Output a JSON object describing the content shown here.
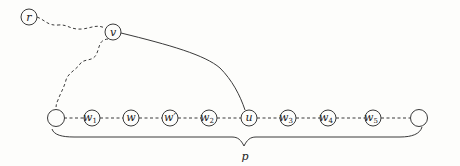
{
  "diagram": {
    "type": "graph",
    "colors": {
      "stroke": "#3a3a3a",
      "background": "#fdfdfb",
      "label": "#222222"
    },
    "nodes": [
      {
        "id": "r",
        "label": "r",
        "sub": "",
        "x": 29,
        "y": 17
      },
      {
        "id": "v",
        "label": "v",
        "sub": "",
        "x": 113,
        "y": 32
      },
      {
        "id": "start",
        "label": "",
        "sub": "",
        "x": 56,
        "y": 118
      },
      {
        "id": "w1",
        "label": "w",
        "sub": "1",
        "x": 92,
        "y": 118
      },
      {
        "id": "w",
        "label": "w",
        "sub": "",
        "x": 131,
        "y": 118
      },
      {
        "id": "wprime",
        "label": "w′",
        "sub": "",
        "x": 170,
        "y": 118
      },
      {
        "id": "w2",
        "label": "w",
        "sub": "2",
        "x": 209,
        "y": 118
      },
      {
        "id": "u",
        "label": "u",
        "sub": "",
        "x": 249,
        "y": 118
      },
      {
        "id": "w3",
        "label": "w",
        "sub": "3",
        "x": 288,
        "y": 118
      },
      {
        "id": "w4",
        "label": "w",
        "sub": "4",
        "x": 328,
        "y": 118
      },
      {
        "id": "w5",
        "label": "w",
        "sub": "5",
        "x": 373,
        "y": 118
      },
      {
        "id": "end",
        "label": "",
        "sub": "",
        "x": 419,
        "y": 118
      }
    ],
    "edges": [
      {
        "from": "r",
        "to": "v",
        "style": "dashed-wavy"
      },
      {
        "from": "v",
        "to": "start",
        "style": "dashed-wavy"
      },
      {
        "from": "v",
        "to": "u",
        "style": "solid-curve"
      },
      {
        "from": "start",
        "to": "w1",
        "style": "dashed"
      },
      {
        "from": "w1",
        "to": "w",
        "style": "dashed"
      },
      {
        "from": "w",
        "to": "wprime",
        "style": "dashed"
      },
      {
        "from": "wprime",
        "to": "w2",
        "style": "dashed"
      },
      {
        "from": "w2",
        "to": "u",
        "style": "dashed"
      },
      {
        "from": "u",
        "to": "w3",
        "style": "dashed"
      },
      {
        "from": "w3",
        "to": "w4",
        "style": "dashed"
      },
      {
        "from": "w4",
        "to": "w5",
        "style": "dashed"
      },
      {
        "from": "w5",
        "to": "end",
        "style": "dashed"
      }
    ],
    "brace": {
      "label": "p",
      "x_start": 52,
      "x_end": 422,
      "y": 134,
      "tip_x": 244,
      "tip_y": 146
    }
  }
}
